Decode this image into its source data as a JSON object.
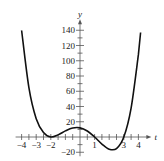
{
  "chart_data": {
    "type": "line",
    "title": "",
    "xlabel": "t",
    "ylabel": "y",
    "xlim": [
      -4,
      4
    ],
    "ylim": [
      -20,
      140
    ],
    "grid": false,
    "legend": null,
    "x_ticks": [
      {
        "value": -4,
        "label": "-4"
      },
      {
        "value": -3,
        "label": "-3"
      },
      {
        "value": -2,
        "label": "-2"
      },
      {
        "value": 1,
        "label": "1"
      },
      {
        "value": 3,
        "label": "3"
      },
      {
        "value": 4,
        "label": "4"
      }
    ],
    "x_minor_step": 0.5,
    "y_ticks": [
      {
        "value": -20,
        "label": "-20"
      },
      {
        "value": 20,
        "label": "20"
      },
      {
        "value": 40,
        "label": "40"
      },
      {
        "value": 60,
        "label": "60"
      },
      {
        "value": 80,
        "label": "80"
      },
      {
        "value": 100,
        "label": "100"
      },
      {
        "value": 120,
        "label": "120"
      },
      {
        "value": 140,
        "label": "140"
      }
    ],
    "y_minor_step": 10,
    "series": [
      {
        "name": "y = (t+2)^2 (t-1)(t-3)",
        "x": [
          -4,
          -3.5,
          -3,
          -2.5,
          -2,
          -1.5,
          -1,
          -0.5,
          0,
          0.5,
          1,
          1.5,
          2,
          2.5,
          3,
          3.5,
          4
        ],
        "y": [
          140,
          64.7,
          24,
          5.9,
          0,
          2.8,
          8,
          11.8,
          12,
          7.8,
          0,
          -9.2,
          -16,
          -15.2,
          0,
          38.0,
          108
        ]
      }
    ],
    "annotations": []
  }
}
